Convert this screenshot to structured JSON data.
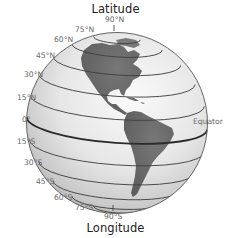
{
  "title": "Latitude",
  "subtitle": "Longitude",
  "equator_label": "Equator",
  "latitude_labels": {
    "n90": "90°N",
    "n75": "75°N",
    "n60": "60°N",
    "n45": "45°N",
    "n30": "30°N",
    "n15": "15°N",
    "eq": "0°",
    "s15": "15°S",
    "s30": "30°S",
    "s45": "45°S",
    "s60": "60°S",
    "s75": "75°S",
    "s90": "90°S"
  },
  "latitudes": [
    75,
    60,
    45,
    30,
    15,
    0,
    -15,
    -30,
    -45,
    -60,
    -75
  ],
  "continents": [
    "North America",
    "South America"
  ],
  "colors": {
    "land": "#6b6b6b",
    "ocean_light": "#f4f4f4",
    "ocean_dark": "#b8b8b8",
    "lines": "#3a3a3a",
    "label": "#6a6a6a"
  }
}
